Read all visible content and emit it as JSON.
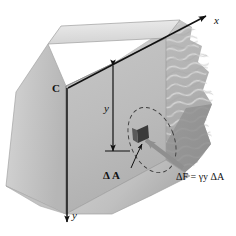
{
  "figure": {
    "kind": "engineering-diagram",
    "background_color": "#ffffff"
  },
  "axes": {
    "origin_label": "C",
    "x_axis": {
      "label": "x",
      "direction": "up-right",
      "arrowhead": "end"
    },
    "y_axis": {
      "label": "y",
      "direction": "down",
      "arrowhead": "end"
    }
  },
  "dimensions": [
    {
      "name": "depth-dimension",
      "label": "y",
      "style": "double-headed-arrow",
      "orientation": "vertical"
    }
  ],
  "callouts": [
    {
      "name": "delta-area-callout",
      "label": "Δ A",
      "points_to": "differential-area-element"
    }
  ],
  "equations": [
    {
      "name": "delta-force-equation",
      "text": "ΔF = γy ΔA"
    }
  ],
  "elements": {
    "wall": {
      "name": "dam-wall",
      "faces": [
        "left-face",
        "front-face",
        "top-face"
      ]
    },
    "water": {
      "name": "water-body",
      "surface_texture": "wavy-lines",
      "right_edge": "torn"
    },
    "area_element": {
      "name": "differential-area-element",
      "shape": "small-dark-square"
    },
    "pressure_arrow": {
      "name": "pressure-force-arrow",
      "style": "thick-gray-arrow"
    },
    "ellipse": {
      "name": "highlight-ellipse",
      "style": "dashed",
      "tilt": "rotated"
    }
  },
  "colors": {
    "wall_left_face": "#c9c9c9",
    "wall_front_face": "#bdbdbd",
    "wall_top_face": "#e2e2e2",
    "water_fill": "#b4b4b4",
    "water_texture": "#d2d2d2",
    "area_element": "#3a3a3a",
    "pressure_arrow": "#8f8f8f",
    "line": "#111111",
    "text": "#111111"
  }
}
